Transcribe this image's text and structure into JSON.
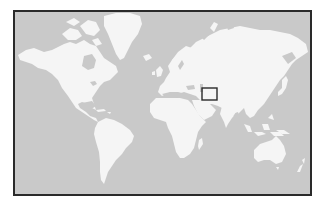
{
  "map": {
    "type": "world-locator-map",
    "projection": "mercator",
    "colors": {
      "ocean": "#c9c9c9",
      "land": "#f5f5f5",
      "frame": "#2a2a2a",
      "marker": "#2a2a2a"
    },
    "highlight_marker": {
      "shape": "rectangle",
      "region": "Central Asia / Afghanistan area",
      "x": 201,
      "y": 87,
      "width": 16,
      "height": 13
    },
    "landmasses": [
      "North America",
      "Greenland",
      "South America",
      "Europe",
      "Asia",
      "Africa",
      "Australia"
    ]
  }
}
